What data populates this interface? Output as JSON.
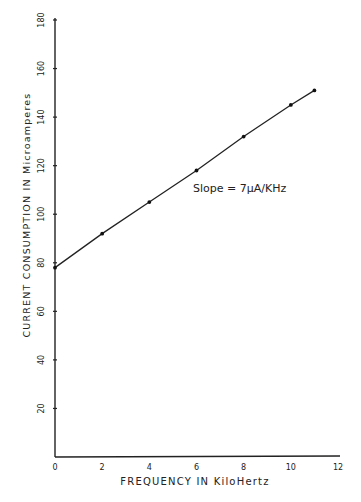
{
  "chart_data": {
    "type": "line",
    "title": "",
    "xlabel": "FREQUENCY IN KiloHertz",
    "ylabel": "CURRENT CONSUMPTION IN Microamperes",
    "x_ticks": [
      "0",
      "2",
      "4",
      "6",
      "8",
      "10",
      "12"
    ],
    "y_ticks": [
      "20",
      "40",
      "60",
      "80",
      "100",
      "120",
      "140",
      "160",
      "180"
    ],
    "xlim": [
      0,
      12
    ],
    "ylim": [
      0,
      180
    ],
    "grid": false,
    "legend": null,
    "series": [
      {
        "name": "Current consumption",
        "x": [
          0,
          2,
          4,
          6,
          8,
          10,
          11
        ],
        "y": [
          78,
          92,
          105,
          118,
          132,
          145,
          151
        ]
      }
    ],
    "annotations": [
      {
        "text": "Slope = 7µA/kHz",
        "x": 6,
        "y": 107
      }
    ]
  },
  "labels": {
    "xlabel": "FREQUENCY  IN  KiloHertz",
    "ylabel": "CURRENT  CONSUMPTION  IN  Microamperes",
    "annotation": "Slope = 7µA/KHz"
  },
  "style": {
    "ink": "#222222",
    "background": "#ffffff"
  }
}
